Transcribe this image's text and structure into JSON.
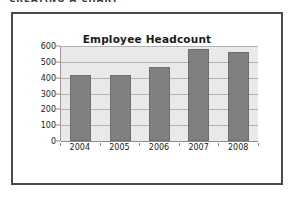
{
  "page": {
    "heading": "CREATING A CHART"
  },
  "figure": {
    "frame_color": "#4a4a4a"
  },
  "chart_data": {
    "type": "bar",
    "title": "Employee Headcount",
    "xlabel": "",
    "ylabel": "",
    "categories": [
      "2004",
      "2005",
      "2006",
      "2007",
      "2008"
    ],
    "values": [
      420,
      420,
      470,
      580,
      565
    ],
    "ylim": [
      0,
      600
    ],
    "yticks": [
      0,
      100,
      200,
      300,
      400,
      500,
      600
    ],
    "ytick_labels": [
      "0",
      "100",
      "200",
      "300",
      "400",
      "500",
      "600"
    ],
    "grid": true,
    "legend": false,
    "bar_color": "#808080",
    "plot_background": "#e9e9e9",
    "gridline_color": "#b2b2b2"
  }
}
